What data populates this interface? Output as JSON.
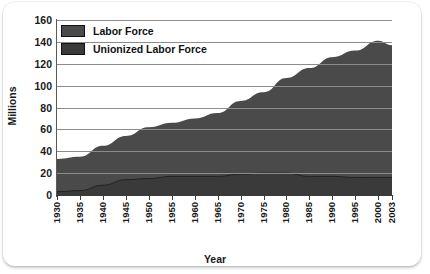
{
  "chart_data": {
    "type": "area",
    "title": "",
    "xlabel": "Year",
    "ylabel": "Millions",
    "xlim": [
      1930,
      2003
    ],
    "ylim": [
      0,
      160
    ],
    "grid": true,
    "legend_position": "top-left",
    "categories": [
      1930,
      1935,
      1940,
      1945,
      1950,
      1955,
      1960,
      1965,
      1970,
      1975,
      1980,
      1985,
      1990,
      1995,
      2000,
      2003
    ],
    "series": [
      {
        "name": "Labor Force",
        "color": "#4a4a4a",
        "values": [
          33,
          35,
          45,
          54,
          62,
          66,
          70,
          75,
          86,
          94,
          107,
          116,
          126,
          132,
          141,
          137
        ]
      },
      {
        "name": "Unionized Labor Force",
        "color": "#3a3a3a",
        "values": [
          3,
          4,
          9,
          14,
          15,
          17,
          17,
          17,
          19,
          20,
          20,
          17,
          17,
          16,
          16,
          16
        ]
      }
    ],
    "yticks": [
      0,
      20,
      40,
      60,
      80,
      100,
      120,
      140,
      160
    ],
    "xticks": [
      "1930",
      "1935",
      "1940",
      "1945",
      "1950",
      "1955",
      "1960",
      "1965",
      "1970",
      "1975",
      "1980",
      "1985",
      "1990",
      "1995",
      "2000",
      "2003"
    ]
  },
  "legend": {
    "items": [
      {
        "label": "Labor Force"
      },
      {
        "label": "Unionized Labor Force"
      }
    ]
  },
  "axes": {
    "y_title": "Millions",
    "x_title": "Year"
  }
}
